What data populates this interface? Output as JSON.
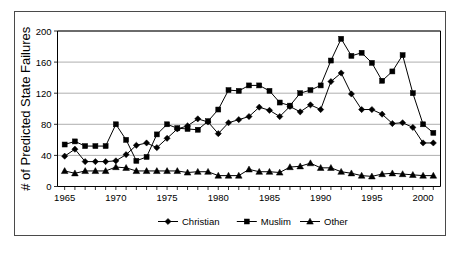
{
  "chart_data": {
    "type": "line",
    "title": "",
    "xlabel": "",
    "ylabel": "# of Predicted State Failures",
    "xlim": [
      1964.3,
      2001.7
    ],
    "ylim": [
      0,
      200
    ],
    "ytick_values": [
      0,
      40,
      80,
      120,
      160,
      200
    ],
    "ytick_labels": [
      "0",
      "40",
      "80",
      "120",
      "160",
      "200"
    ],
    "xtick_labels": [
      "1965",
      "1970",
      "1975",
      "1980",
      "1985",
      "1990",
      "1995",
      "2000"
    ],
    "xtick_values": [
      1965,
      1970,
      1975,
      1980,
      1985,
      1990,
      1995,
      2000
    ],
    "minor_xticks_every": 1,
    "grid": "horizontal",
    "legend_position": "bottom",
    "x": [
      1965,
      1966,
      1967,
      1968,
      1969,
      1970,
      1971,
      1972,
      1973,
      1974,
      1975,
      1976,
      1977,
      1978,
      1979,
      1980,
      1981,
      1982,
      1983,
      1984,
      1985,
      1986,
      1987,
      1988,
      1989,
      1990,
      1991,
      1992,
      1993,
      1994,
      1995,
      1996,
      1997,
      1998,
      1999,
      2000,
      2001
    ],
    "series": [
      {
        "name": "Christian",
        "marker": "diamond",
        "color": "#000000",
        "values": [
          39,
          48,
          32,
          32,
          32,
          33,
          41,
          53,
          56,
          50,
          62,
          74,
          78,
          87,
          83,
          68,
          82,
          86,
          90,
          102,
          98,
          90,
          103,
          96,
          105,
          99,
          135,
          146,
          119,
          99,
          99,
          93,
          81,
          82,
          76,
          56,
          56
        ]
      },
      {
        "name": "Muslim",
        "marker": "square",
        "color": "#000000",
        "values": [
          54,
          58,
          52,
          52,
          52,
          80,
          60,
          33,
          38,
          67,
          80,
          75,
          74,
          73,
          84,
          99,
          124,
          123,
          130,
          130,
          123,
          108,
          104,
          120,
          124,
          130,
          162,
          190,
          168,
          172,
          159,
          136,
          148,
          169,
          120,
          80,
          69
        ]
      },
      {
        "name": "Other",
        "marker": "triangle",
        "color": "#000000",
        "values": [
          20,
          17,
          20,
          20,
          20,
          25,
          24,
          20,
          20,
          20,
          20,
          20,
          18,
          19,
          19,
          14,
          14,
          14,
          22,
          19,
          19,
          18,
          25,
          26,
          30,
          24,
          24,
          19,
          17,
          14,
          13,
          16,
          17,
          16,
          15,
          14,
          14
        ]
      }
    ]
  },
  "legend": {
    "items": [
      {
        "label": "Christian",
        "marker": "diamond"
      },
      {
        "label": "Muslim",
        "marker": "square"
      },
      {
        "label": "Other",
        "marker": "triangle"
      }
    ]
  }
}
